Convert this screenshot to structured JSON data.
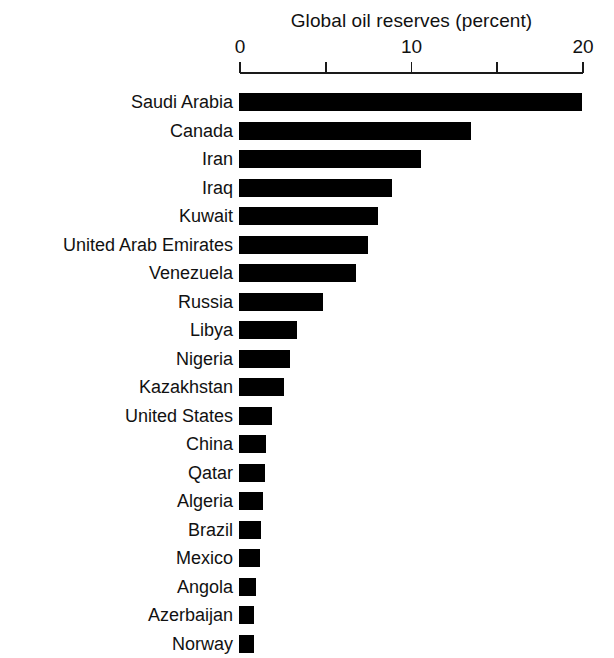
{
  "chart_data": {
    "type": "bar",
    "orientation": "horizontal",
    "title": "Global oil reserves (percent)",
    "xlabel": "",
    "ylabel": "",
    "xlim": [
      0,
      20
    ],
    "grid": false,
    "legend": null,
    "tick_values": [
      0,
      5,
      10,
      15,
      20
    ],
    "tick_labels": [
      "0",
      "",
      "10",
      "",
      "20"
    ],
    "bar_color": "#000000",
    "categories": [
      "Saudi Arabia",
      "Canada",
      "Iran",
      "Iraq",
      "Kuwait",
      "United Arab Emirates",
      "Venezuela",
      "Russia",
      "Libya",
      "Nigeria",
      "Kazakhstan",
      "United States",
      "China",
      "Qatar",
      "Algeria",
      "Brazil",
      "Mexico",
      "Angola",
      "Azerbaijan",
      "Norway"
    ],
    "values": [
      20.0,
      13.5,
      10.6,
      8.9,
      8.1,
      7.5,
      6.8,
      4.9,
      3.4,
      3.0,
      2.6,
      1.9,
      1.6,
      1.5,
      1.4,
      1.3,
      1.2,
      1.0,
      0.9,
      0.85
    ]
  }
}
